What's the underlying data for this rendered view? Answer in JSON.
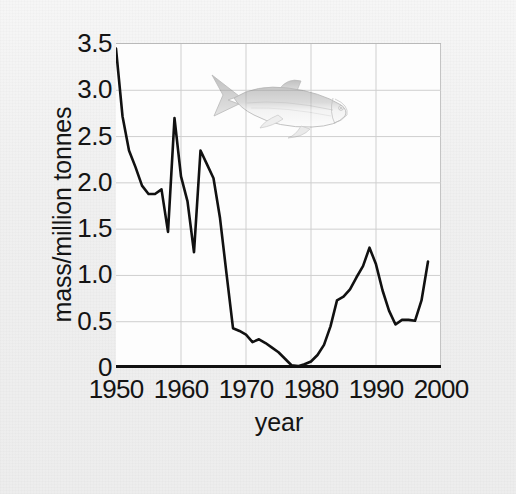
{
  "figure": {
    "background_color": "#f1f1f1",
    "plot_background_color": "#fdfdfd",
    "line_color": "#111111",
    "grid_color": "#cfcfcf",
    "axis_color": "#111111",
    "decoration_icon": "herring-fish-illustration"
  },
  "chart_data": {
    "type": "line",
    "title": "",
    "subtitle": "",
    "xlabel": "year",
    "ylabel": "mass/million tonnes",
    "xlim": [
      1950,
      2000
    ],
    "ylim": [
      0,
      3.5
    ],
    "xticks": [
      1950,
      1960,
      1970,
      1980,
      1990,
      2000
    ],
    "xtick_labels": [
      "1950",
      "1960",
      "1970",
      "1980",
      "1990",
      "2000"
    ],
    "yticks": [
      0,
      0.5,
      1.0,
      1.5,
      2.0,
      2.5,
      3.0,
      3.5
    ],
    "ytick_labels": [
      "0",
      "0.5",
      "1.0",
      "1.5",
      "2.0",
      "2.5",
      "3.0",
      "3.5"
    ],
    "grid": true,
    "grid_axes": "both",
    "legend": null,
    "legend_position": "none",
    "annotations": [
      {
        "name": "herring-fish-illustration",
        "x": 1965,
        "y": 2.9,
        "type": "image"
      }
    ],
    "series": [
      {
        "name": "North Sea herring stock biomass",
        "x": [
          1950,
          1951,
          1952,
          1953,
          1954,
          1955,
          1956,
          1957,
          1958,
          1959,
          1960,
          1961,
          1962,
          1963,
          1964,
          1965,
          1966,
          1967,
          1968,
          1969,
          1970,
          1971,
          1972,
          1973,
          1974,
          1975,
          1976,
          1977,
          1978,
          1979,
          1980,
          1981,
          1982,
          1983,
          1984,
          1985,
          1986,
          1987,
          1988,
          1989,
          1990,
          1991,
          1992,
          1993,
          1994,
          1995,
          1996,
          1997,
          1998
        ],
        "y": [
          3.45,
          2.72,
          2.35,
          2.17,
          1.97,
          1.88,
          1.88,
          1.93,
          1.47,
          2.7,
          2.07,
          1.8,
          1.25,
          2.35,
          2.2,
          2.05,
          1.62,
          1.02,
          0.43,
          0.4,
          0.36,
          0.28,
          0.31,
          0.27,
          0.22,
          0.17,
          0.1,
          0.03,
          0.02,
          0.04,
          0.07,
          0.14,
          0.25,
          0.45,
          0.73,
          0.77,
          0.85,
          0.98,
          1.1,
          1.3,
          1.12,
          0.84,
          0.62,
          0.47,
          0.52,
          0.52,
          0.51,
          0.73,
          1.15
        ]
      }
    ]
  }
}
